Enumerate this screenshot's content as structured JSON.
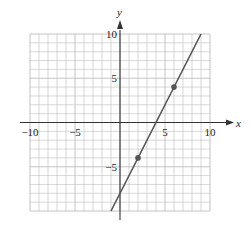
{
  "chart_data": {
    "type": "line",
    "title": "",
    "xlabel": "x",
    "ylabel": "y",
    "xlim": [
      -10,
      10
    ],
    "ylim": [
      -10,
      10
    ],
    "grid": true,
    "grid_step": 1,
    "x_ticks": [
      -10,
      -5,
      5,
      10
    ],
    "y_ticks": [
      10,
      5,
      -5
    ],
    "x_tick_labels": [
      "−10",
      "−5",
      "5",
      "10"
    ],
    "y_tick_labels": [
      "10",
      "5",
      "−5"
    ],
    "series": [
      {
        "name": "y = 2x − 8",
        "equation": "y = 2x - 8",
        "slope": 2,
        "intercept": -8,
        "line_endpoints": [
          [
            -1,
            -10
          ],
          [
            9,
            10
          ]
        ],
        "marked_points": [
          [
            2,
            -4
          ],
          [
            6,
            4
          ]
        ]
      }
    ],
    "colors": {
      "line": "#555555",
      "grid": "#bdbdbd",
      "axes": "#333333",
      "points": "#555555"
    }
  }
}
